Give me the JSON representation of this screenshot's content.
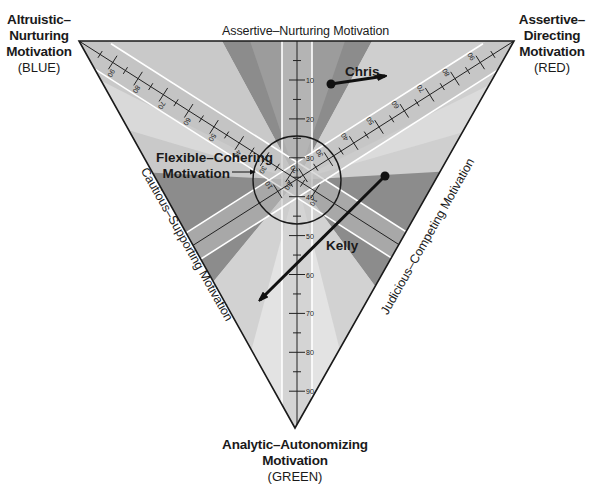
{
  "diagram": {
    "title_corners": {
      "blue": {
        "name": "Altruistic–Nurturing Motivation",
        "lines": [
          "Altruistic–",
          "Nurturing",
          "Motivation"
        ],
        "color_label": "(BLUE)"
      },
      "red": {
        "name": "Assertive–Directing Motivation",
        "lines": [
          "Assertive–",
          "Directing",
          "Motivation"
        ],
        "color_label": "(RED)"
      },
      "green": {
        "name": "Analytic–Autonomizing Motivation",
        "lines": [
          "Analytic–Autonomizing",
          "Motivation"
        ],
        "color_label": "(GREEN)"
      }
    },
    "edge_labels": {
      "top": "Assertive–Nurturing Motivation",
      "left": "Cautious–Supporting Motivation",
      "right": "Judicious–Competing Motivation"
    },
    "center_label": {
      "lines": [
        "Flexible–Cohering",
        "Motivation"
      ]
    },
    "axes": {
      "vertical_ticks": [
        "10",
        "20",
        "30",
        "40",
        "50",
        "60",
        "70",
        "80",
        "90"
      ],
      "blue_axis_ticks": [
        "90",
        "80",
        "70",
        "60",
        "50",
        "40",
        "30",
        "20",
        "10"
      ],
      "red_axis_ticks": [
        "90",
        "80",
        "70",
        "60",
        "50",
        "40",
        "30",
        "20",
        "10"
      ]
    },
    "people": [
      {
        "name": "Chris",
        "start": [
          331,
          84
        ],
        "end": [
          385,
          76
        ]
      },
      {
        "name": "Kelly",
        "start": [
          385,
          176
        ],
        "end": [
          260,
          300
        ]
      }
    ],
    "colors": {
      "outline": "#1a1a1a",
      "light_zone": "#d9d9d9",
      "mid_zone": "#b8b8b8",
      "dark_zone": "#8f8f8f",
      "center_zone": "#e6e6e6",
      "band": "#c4c4c4",
      "band_edge": "#ffffff"
    }
  }
}
